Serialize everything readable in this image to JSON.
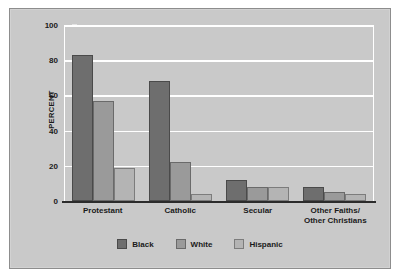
{
  "chart_data": {
    "type": "bar",
    "title": "",
    "xlabel": "",
    "ylabel": "PERCENT",
    "ylim": [
      0,
      100
    ],
    "yticks": [
      0,
      20,
      40,
      60,
      80,
      100
    ],
    "grid": true,
    "legend_position": "bottom-center",
    "categories": [
      "Protestant",
      "Catholic",
      "Secular",
      "Other Faiths/\nOther Christians"
    ],
    "series": [
      {
        "name": "Black",
        "color": "#6e6e6e",
        "values": [
          83,
          68,
          12,
          8
        ]
      },
      {
        "name": "White",
        "color": "#9a9a9a",
        "values": [
          57,
          22,
          8,
          5
        ]
      },
      {
        "name": "Hispanic",
        "color": "#b4b4b4",
        "values": [
          19,
          4,
          8,
          4
        ]
      }
    ]
  },
  "axis": {
    "y_label": "PERCENT",
    "y_tick_labels": [
      "100",
      "80",
      "60",
      "40",
      "20",
      "0"
    ],
    "x_tick_labels": [
      "Protestant",
      "Catholic",
      "Secular",
      "Other Faiths/\nOther Christians"
    ]
  },
  "legend": {
    "items": [
      {
        "label": "Black"
      },
      {
        "label": "White"
      },
      {
        "label": "Hispanic"
      }
    ]
  }
}
